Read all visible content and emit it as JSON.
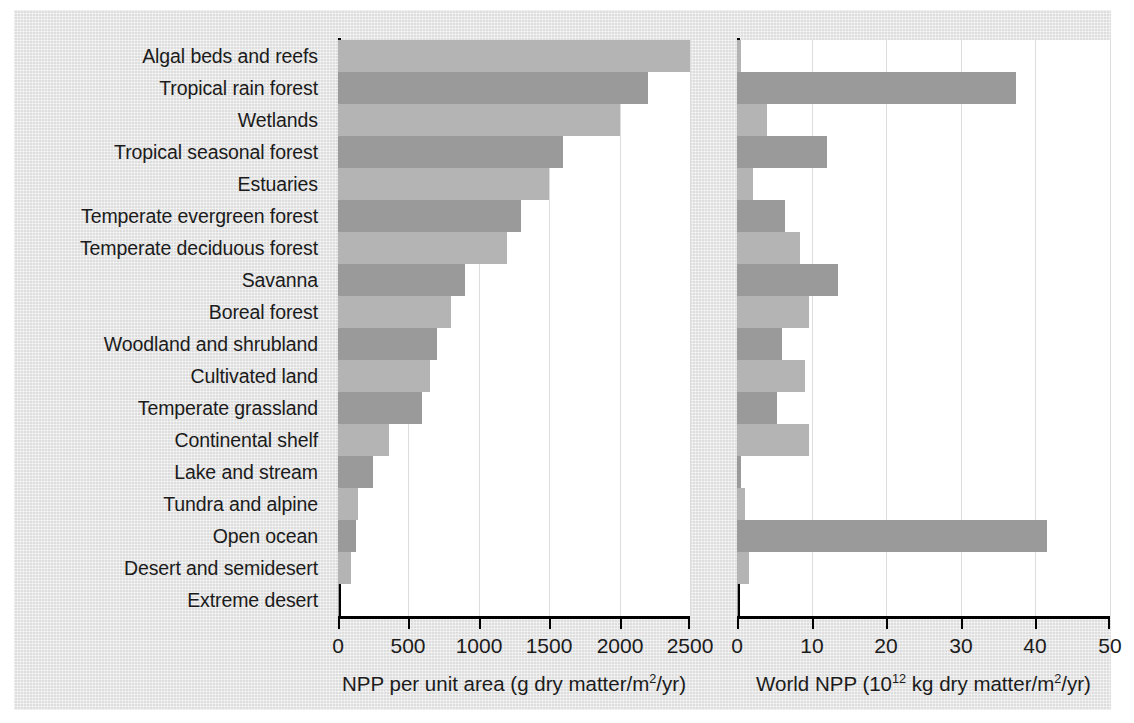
{
  "figure": {
    "background_color": "#e3e3e3",
    "plot_background_color": "#ffffff",
    "bar_color_light": "#b4b4b4",
    "bar_color_dark": "#9a9a9a",
    "axis_color": "#000000",
    "gridline_color": "#dddddd"
  },
  "chart_data": {
    "type": "bar",
    "orientation": "horizontal",
    "title": "",
    "grid": true,
    "legend": "none",
    "categories": [
      "Algal beds and reefs",
      "Tropical rain forest",
      "Wetlands",
      "Tropical seasonal forest",
      "Estuaries",
      "Temperate evergreen forest",
      "Temperate deciduous forest",
      "Savanna",
      "Boreal forest",
      "Woodland and shrubland",
      "Cultivated land",
      "Temperate grassland",
      "Continental shelf",
      "Lake and stream",
      "Tundra and alpine",
      "Open ocean",
      "Desert and semidesert",
      "Extreme desert"
    ],
    "panels": [
      {
        "id": "npp-per-unit-area",
        "xlabel": "NPP per unit area (g dry matter/m2/yr)",
        "xlabel_parts": {
          "pre": "NPP per unit area (g dry matter/m",
          "sup": "2",
          "post": "/yr)"
        },
        "xlim": [
          0,
          2500
        ],
        "xticks": [
          0,
          500,
          1000,
          1500,
          2000,
          2500
        ],
        "xticklabels": [
          "0",
          "500",
          "1000",
          "1500",
          "2000",
          "2500"
        ],
        "values": [
          2500,
          2200,
          2000,
          1600,
          1500,
          1300,
          1200,
          900,
          800,
          700,
          650,
          600,
          360,
          250,
          140,
          125,
          90,
          3
        ]
      },
      {
        "id": "world-npp",
        "xlabel": "World NPP (1012 kg dry matter/m2/yr)",
        "xlabel_parts": {
          "pre": "World NPP (10",
          "sup": "12",
          "mid": " kg dry matter/m",
          "sup2": "2",
          "post": "/yr)"
        },
        "xlim": [
          0,
          50
        ],
        "xticks": [
          0,
          10,
          20,
          30,
          40,
          50
        ],
        "xticklabels": [
          "0",
          "10",
          "20",
          "30",
          "40",
          "50"
        ],
        "values": [
          0.5,
          37.4,
          4.0,
          12.0,
          2.1,
          6.5,
          8.4,
          13.5,
          9.6,
          6.0,
          9.1,
          5.4,
          9.6,
          0.6,
          1.1,
          41.5,
          1.6,
          0.07
        ]
      }
    ]
  }
}
